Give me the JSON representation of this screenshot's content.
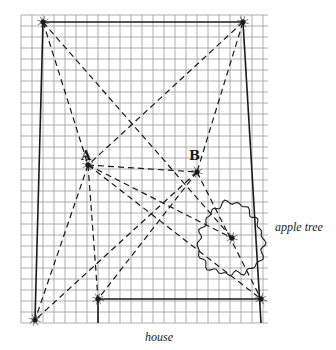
{
  "diagram": {
    "type": "geometric-survey-diagram",
    "grid": {
      "x0": 21,
      "y0": 15,
      "x1": 268,
      "y1": 323,
      "cell": 11,
      "color": "#9a9a9a"
    },
    "points": {
      "top_left": [
        43,
        22
      ],
      "top_right": [
        243,
        22
      ],
      "A": [
        88,
        165
      ],
      "B": [
        197,
        172
      ],
      "tree_center": [
        232,
        238
      ],
      "bottom_left": [
        35,
        320
      ],
      "house_left": [
        98,
        299
      ],
      "house_right": [
        261,
        299
      ]
    },
    "labels": {
      "point_a": "A",
      "point_b": "B",
      "tree": "apple tree",
      "house": "house"
    },
    "tree": {
      "cx": 231,
      "cy": 240,
      "r": 34
    },
    "colors": {
      "ink": "#1a1a1a",
      "grid": "#9a9a9a",
      "background": "#ffffff"
    }
  }
}
